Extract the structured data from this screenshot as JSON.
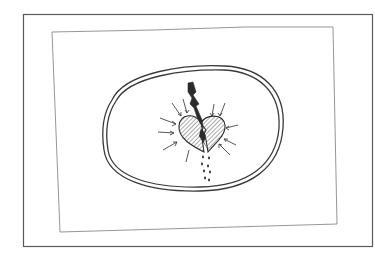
{
  "image": {
    "description": "Hand-drawn pencil sketch of a broken heart struck by a lightning bolt, inside a double oval, on a paper card within a frame",
    "alt_text": "Sketch of a heart split by lightning with dripping drops",
    "background": "#ffffff",
    "colors": {
      "frame": "#5a5a5a",
      "paper_edge": "#8a8a8a",
      "ink": "#2b2b2b",
      "hatch": "#555555"
    },
    "elements": {
      "outer_frame": "picture-frame",
      "inner_paper": "paper-sheet",
      "oval": "double-oval",
      "heart": "broken-heart",
      "bolt": "lightning-bolt",
      "rays": "radiating-arrows",
      "drops": "falling-drops"
    }
  }
}
